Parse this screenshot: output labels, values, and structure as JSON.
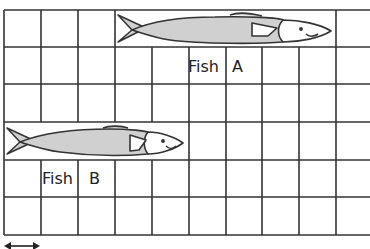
{
  "grid": {
    "columns": 10,
    "rows": 6,
    "cell_size_px": 37,
    "line_color": "#333333"
  },
  "fish": [
    {
      "name": "Fish A",
      "word": "Fish",
      "letter": "A",
      "start_col": 3,
      "end_col": 9,
      "row": 0,
      "length_units": 6
    },
    {
      "name": "Fish B",
      "word": "Fish",
      "letter": "B",
      "start_col": 0,
      "end_col": 5,
      "row": 3,
      "length_units": 5
    }
  ],
  "colors": {
    "fish_body": "#d0d0d0",
    "fish_outline": "#333333",
    "fish_head": "#ffffff"
  },
  "scale": {
    "icon": "double-arrow",
    "length_units": 1
  }
}
